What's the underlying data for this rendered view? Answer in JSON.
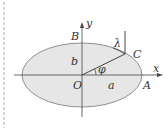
{
  "diagram": {
    "type": "ellipse-geometry",
    "colors": {
      "ellipse_fill": "#e6e6e6",
      "ellipse_stroke": "#777777",
      "axis": "#444444",
      "line": "#333333",
      "text": "#333333",
      "dashed_border": "#9a9a9a",
      "background": "#ffffff"
    },
    "labels": {
      "y_axis": "y",
      "x_axis": "x",
      "origin": "O",
      "point_B": "B",
      "point_A": "A",
      "point_C": "C",
      "semi_minor": "b",
      "semi_major": "a",
      "angle_phi": "φ",
      "angle_lambda": "λ"
    }
  }
}
